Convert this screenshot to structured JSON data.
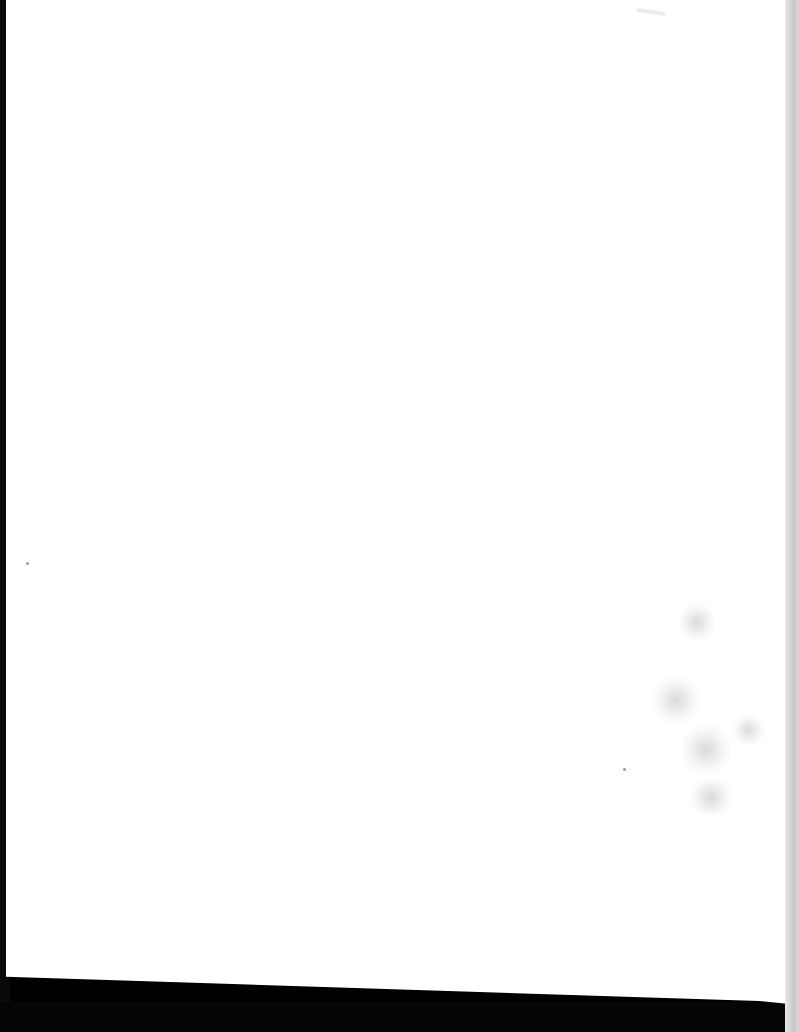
{
  "document": {
    "type": "scanned-page",
    "content": "",
    "text_blocks": [],
    "colors": {
      "page": "#ffffff",
      "scan_border": "#000000",
      "right_edge_shadow": "#d0d0d0"
    }
  }
}
